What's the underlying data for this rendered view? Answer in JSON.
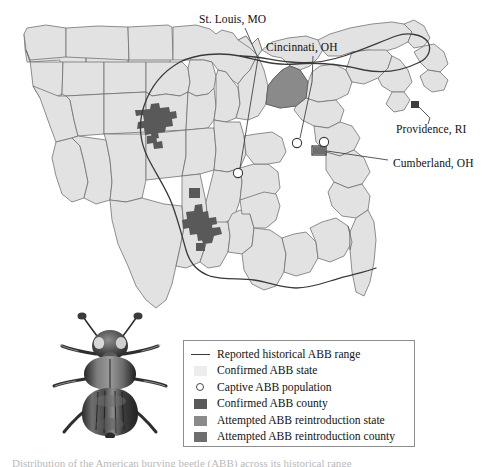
{
  "figure": {
    "kind": "distribution-map",
    "region": "Eastern and central United States",
    "caption_partial": "Distribution of the American burying beetle (ABB) across its historical range"
  },
  "callouts": [
    {
      "id": "st-louis",
      "label": "St. Louis, MO",
      "marker": "captive-population"
    },
    {
      "id": "cincinnati",
      "label": "Cincinnati, OH",
      "marker": "captive-population"
    },
    {
      "id": "providence",
      "label": "Providence, RI",
      "marker": "confirmed-county"
    },
    {
      "id": "cumberland",
      "label": "Cumberland, OH",
      "marker": "reintroduction-county"
    }
  ],
  "legend": {
    "items": [
      {
        "key": "line",
        "label": "Reported historical ABB range",
        "color": "#3a3a3a"
      },
      {
        "key": "swatch",
        "label": "Confirmed ABB state",
        "color": "#ededed"
      },
      {
        "key": "circle",
        "label": "Captive ABB population",
        "color": "#ffffff"
      },
      {
        "key": "swatch",
        "label": "Confirmed ABB county",
        "color": "#595959"
      },
      {
        "key": "swatch",
        "label": "Attempted ABB reintroduction state",
        "color": "#8a8a8a"
      },
      {
        "key": "swatch",
        "label": "Attempted ABB reintroduction county",
        "color": "#6e6e6e"
      }
    ]
  },
  "colors": {
    "state_fill": "#e2e2e2",
    "state_stroke": "#6b6b6b",
    "confirmed_county": "#595959",
    "reintroduction_state": "#8a8a8a",
    "reintroduction_county": "#6e6e6e",
    "range_line": "#3a3a3a",
    "captive_circle": "#ffffff",
    "background": "#ffffff",
    "legend_border": "#8d8d8d"
  },
  "map_features": {
    "confirmed_ABB_counties": [
      "Nebraska Sandhills cluster",
      "Oklahoma / Arkansas cluster"
    ],
    "reintroduction_states": [
      "Ohio"
    ],
    "reintroduction_counties": [
      "Cumberland, OH"
    ],
    "confirmed_counties_east": [
      "Block Island, RI"
    ],
    "captive_populations": [
      "St. Louis, MO",
      "Cincinnati, OH"
    ]
  },
  "inset": {
    "photo": "american-burying-beetle-specimen"
  }
}
